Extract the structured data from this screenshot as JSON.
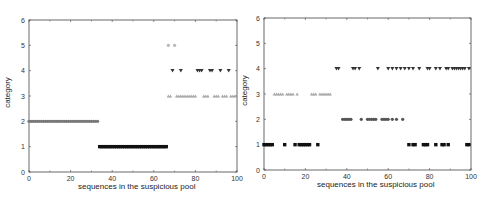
{
  "chart_data": [
    {
      "type": "scatter",
      "title": "",
      "xlabel": "sequences in the suspicious pool",
      "ylabel": "category",
      "xlim": [
        0,
        100
      ],
      "ylim": [
        0,
        6
      ],
      "xticks": [
        "0",
        "20",
        "40",
        "60",
        "80",
        "100"
      ],
      "yticks": [
        "0",
        "1",
        "2",
        "3",
        "4",
        "5",
        "6"
      ],
      "grid": false,
      "legend": null,
      "series": [
        {
          "name": "category 2",
          "marker": "circle",
          "color": "#777777",
          "y": 2,
          "x": [
            0,
            1,
            2,
            3,
            4,
            5,
            6,
            7,
            8,
            9,
            10,
            11,
            12,
            13,
            14,
            15,
            16,
            17,
            18,
            19,
            20,
            21,
            22,
            23,
            24,
            25,
            26,
            27,
            28,
            29,
            30,
            31,
            32,
            33
          ]
        },
        {
          "name": "category 1",
          "marker": "square",
          "color": "#111111",
          "y": 1,
          "x": [
            34,
            35,
            36,
            37,
            38,
            39,
            40,
            41,
            42,
            43,
            44,
            45,
            46,
            47,
            48,
            49,
            50,
            51,
            52,
            53,
            54,
            55,
            56,
            57,
            58,
            59,
            60,
            61,
            62,
            63,
            64,
            65,
            66
          ]
        },
        {
          "name": "category 5",
          "marker": "circle",
          "color": "#b5b5b5",
          "y": 5,
          "x": [
            67,
            70
          ]
        },
        {
          "name": "category 4",
          "marker": "triangle-down",
          "color": "#333333",
          "y": 4,
          "x": [
            69,
            73,
            81,
            82,
            83,
            87,
            88,
            92,
            96
          ]
        },
        {
          "name": "category 3",
          "marker": "triangle-up",
          "color": "#a8a8a8",
          "y": 3,
          "x": [
            67,
            68,
            71,
            72,
            73,
            74,
            75,
            76,
            77,
            78,
            79,
            80,
            84,
            85,
            86,
            89,
            90,
            91,
            93,
            94,
            95,
            97,
            98,
            99
          ]
        }
      ]
    },
    {
      "type": "scatter",
      "title": "",
      "xlabel": "sequences in the suspicious pool",
      "ylabel": "category",
      "xlim": [
        0,
        100
      ],
      "ylim": [
        0,
        6
      ],
      "xticks": [
        "0",
        "20",
        "40",
        "60",
        "80",
        "100"
      ],
      "yticks": [
        "0",
        "1",
        "2",
        "3",
        "4",
        "5",
        "6"
      ],
      "grid": false,
      "legend": null,
      "series": [
        {
          "name": "category 1",
          "marker": "square",
          "color": "#111111",
          "y": 1,
          "x": [
            0,
            1,
            2,
            3,
            4,
            10,
            15,
            17,
            18,
            19,
            20,
            21,
            22,
            26,
            70,
            72,
            73,
            77,
            78,
            79,
            83,
            86,
            87,
            89,
            98,
            99
          ]
        },
        {
          "name": "category 3",
          "marker": "triangle-up",
          "color": "#a8a8a8",
          "y": 3,
          "x": [
            5,
            6,
            7,
            8,
            9,
            11,
            12,
            13,
            14,
            16,
            23,
            24,
            25,
            27,
            28,
            29,
            30,
            31,
            32
          ]
        },
        {
          "name": "category 4",
          "marker": "triangle-down",
          "color": "#333333",
          "y": 4,
          "x": [
            35,
            36,
            43,
            44,
            46,
            55,
            60,
            62,
            64,
            66,
            68,
            70,
            72,
            75,
            79,
            80,
            83,
            85,
            88,
            89,
            91,
            92,
            93,
            94,
            95,
            96,
            97,
            99
          ]
        },
        {
          "name": "category 2",
          "marker": "circle",
          "color": "#555555",
          "y": 2,
          "x": [
            38,
            39,
            40,
            41,
            42,
            47,
            50,
            51,
            52,
            53,
            54,
            57,
            58,
            59,
            60,
            62,
            64,
            67
          ]
        }
      ]
    }
  ],
  "panels": [
    {
      "xlabel": "sequences in the suspicious pool",
      "ylabel": "category"
    },
    {
      "xlabel": "sequences in the suspicious pool",
      "ylabel": "category"
    }
  ]
}
